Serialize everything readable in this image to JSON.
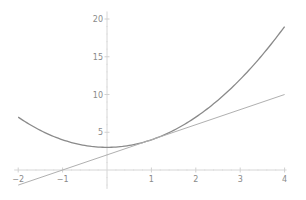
{
  "chart_data": {
    "type": "line",
    "title": "",
    "xlabel": "",
    "ylabel": "",
    "xlim": [
      -2,
      4
    ],
    "ylim": [
      -2.5,
      21
    ],
    "grid": false,
    "legend": null,
    "x_ticks": [
      -2,
      -1,
      1,
      2,
      3,
      4
    ],
    "x_tick_labels": [
      "-2",
      "-1",
      "1",
      "2",
      "3",
      "4"
    ],
    "y_ticks": [
      5,
      10,
      15,
      20
    ],
    "y_tick_labels": [
      "5",
      "10",
      "15",
      "20"
    ],
    "series": [
      {
        "name": "f(x) = x^2 + 3",
        "color": "#8a8a8a",
        "x": [
          -2,
          -1.5,
          -1,
          -0.5,
          0,
          0.5,
          1,
          1.5,
          2,
          2.5,
          3,
          3.5,
          4
        ],
        "values": [
          7,
          5.25,
          4,
          3.25,
          3,
          3.25,
          4,
          5.25,
          7,
          9.25,
          12,
          15.25,
          19
        ]
      },
      {
        "name": "tangent at x=1: y = 2x + 2",
        "color": "#b0b0b0",
        "x": [
          -2,
          4
        ],
        "values": [
          -2,
          10
        ]
      }
    ]
  },
  "plot": {
    "origin_px": [
      107,
      170
    ],
    "x_scale_px": 44.4,
    "y_scale_px": 7.55,
    "axis_color": "#d6d6d6"
  }
}
